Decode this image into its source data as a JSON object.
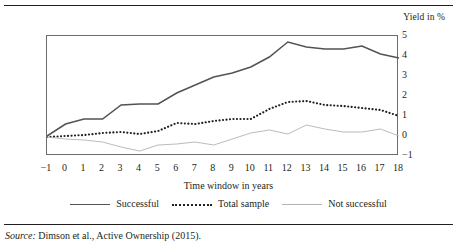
{
  "figure": {
    "clipped_title": "",
    "source_prefix": "Source:",
    "source_text": "Dimson et al., Active Ownership (2015)."
  },
  "chart_data": {
    "type": "line",
    "title": "",
    "xlabel": "Time window in years",
    "ylabel": "Yield in %",
    "ylim": [
      -1,
      5
    ],
    "xlim": [
      -1,
      18
    ],
    "grid": false,
    "legend_position": "bottom",
    "xticks": [
      "−1",
      "0",
      "1",
      "2",
      "3",
      "4",
      "5",
      "6",
      "7",
      "8",
      "9",
      "10",
      "11",
      "12",
      "13",
      "14",
      "15",
      "16",
      "17",
      "18"
    ],
    "yticks": [
      "5",
      "4",
      "3",
      "2",
      "1",
      "0",
      "−1"
    ],
    "x": [
      -1,
      0,
      1,
      2,
      3,
      4,
      5,
      6,
      7,
      8,
      9,
      10,
      11,
      12,
      13,
      14,
      15,
      16,
      17,
      18
    ],
    "series": [
      {
        "name": "Successful",
        "style": "solid",
        "color": "#54534f",
        "values": [
          0.0,
          0.6,
          0.85,
          0.85,
          1.55,
          1.6,
          1.6,
          2.15,
          2.55,
          2.95,
          3.15,
          3.45,
          3.95,
          4.7,
          4.45,
          4.35,
          4.35,
          4.5,
          4.1,
          3.9
        ]
      },
      {
        "name": "Total sample",
        "style": "dotted",
        "color": "#231f20",
        "values": [
          -0.05,
          0.0,
          0.05,
          0.15,
          0.2,
          0.1,
          0.25,
          0.65,
          0.6,
          0.75,
          0.85,
          0.85,
          1.35,
          1.7,
          1.75,
          1.55,
          1.5,
          1.4,
          1.3,
          1.0
        ]
      },
      {
        "name": "Not successful",
        "style": "thin",
        "color": "#b3b3b3",
        "values": [
          -0.05,
          -0.15,
          -0.2,
          -0.3,
          -0.55,
          -0.75,
          -0.45,
          -0.4,
          -0.3,
          -0.45,
          -0.15,
          0.15,
          0.3,
          0.1,
          0.55,
          0.35,
          0.2,
          0.2,
          0.35,
          0.0
        ]
      }
    ]
  }
}
